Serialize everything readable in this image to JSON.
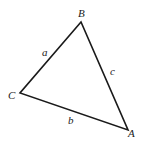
{
  "diagram": {
    "type": "triangle",
    "stroke_color": "#1a1a1a",
    "vertices": [
      {
        "name": "B",
        "x": 81,
        "y": 22,
        "label_x": 78,
        "label_y": 17
      },
      {
        "name": "C",
        "x": 20,
        "y": 93,
        "label_x": 8,
        "label_y": 99
      },
      {
        "name": "A",
        "x": 128,
        "y": 130,
        "label_x": 128,
        "label_y": 137
      }
    ],
    "sides": [
      {
        "name": "a",
        "label_x": 42,
        "label_y": 56
      },
      {
        "name": "c",
        "label_x": 110,
        "label_y": 75
      },
      {
        "name": "b",
        "label_x": 68,
        "label_y": 124
      }
    ]
  }
}
